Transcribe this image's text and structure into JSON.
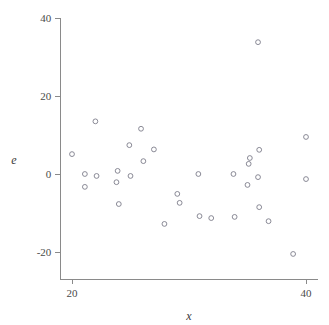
{
  "chart_data": {
    "type": "scatter",
    "title": "",
    "subtitle": "",
    "xlabel": "x",
    "ylabel": "e",
    "xlim": [
      19.0,
      41.0
    ],
    "ylim": [
      -27.0,
      41.0
    ],
    "xticks": [
      20,
      40
    ],
    "xticklabels": [
      "20",
      "40"
    ],
    "yticks": [
      40,
      20,
      0,
      -20
    ],
    "yticklabels": [
      "40",
      "20",
      "0",
      "-20"
    ],
    "grid": false,
    "legend": null,
    "marker": "open-circle",
    "marker_color": "#7d7d8a",
    "axis_color": "#8a8a8a",
    "points": [
      {
        "x": 20.0,
        "y": 5.1
      },
      {
        "x": 21.1,
        "y": 0.0
      },
      {
        "x": 21.1,
        "y": -3.3
      },
      {
        "x": 22.1,
        "y": -0.5
      },
      {
        "x": 22.0,
        "y": 13.5
      },
      {
        "x": 23.9,
        "y": 0.8
      },
      {
        "x": 23.8,
        "y": -2.1
      },
      {
        "x": 24.0,
        "y": -7.7
      },
      {
        "x": 24.9,
        "y": 7.4
      },
      {
        "x": 25.0,
        "y": -0.5
      },
      {
        "x": 25.9,
        "y": 11.6
      },
      {
        "x": 26.1,
        "y": 3.3
      },
      {
        "x": 27.0,
        "y": 6.3
      },
      {
        "x": 27.9,
        "y": -12.8
      },
      {
        "x": 29.0,
        "y": -5.1
      },
      {
        "x": 29.2,
        "y": -7.4
      },
      {
        "x": 30.9,
        "y": -10.8
      },
      {
        "x": 30.8,
        "y": 0.0
      },
      {
        "x": 31.9,
        "y": -11.3
      },
      {
        "x": 33.8,
        "y": 0.0
      },
      {
        "x": 33.9,
        "y": -11.0
      },
      {
        "x": 35.2,
        "y": 4.1
      },
      {
        "x": 35.1,
        "y": 2.6
      },
      {
        "x": 35.0,
        "y": -2.8
      },
      {
        "x": 36.0,
        "y": 6.2
      },
      {
        "x": 35.9,
        "y": -0.8
      },
      {
        "x": 36.0,
        "y": -8.5
      },
      {
        "x": 36.8,
        "y": -12.1
      },
      {
        "x": 35.9,
        "y": 33.8
      },
      {
        "x": 38.9,
        "y": -20.5
      },
      {
        "x": 40.0,
        "y": 9.5
      },
      {
        "x": 40.0,
        "y": -1.3
      }
    ]
  }
}
